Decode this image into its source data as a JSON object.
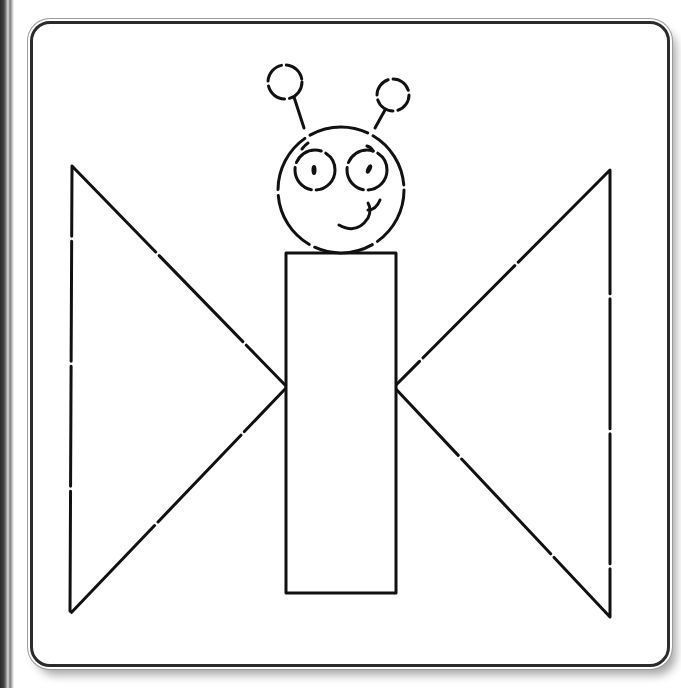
{
  "figure": {
    "shapes": {
      "head": {
        "type": "circle",
        "cx": 341,
        "cy": 190,
        "r": 63
      },
      "left_eye": {
        "type": "circle",
        "cx": 315,
        "cy": 170,
        "r": 20
      },
      "right_eye": {
        "type": "circle",
        "cx": 367,
        "cy": 170,
        "r": 20
      },
      "left_antenna_ball": {
        "type": "circle",
        "cx": 285,
        "cy": 82,
        "r": 17
      },
      "right_antenna_ball": {
        "type": "circle",
        "cx": 393,
        "cy": 95,
        "r": 16
      },
      "body": {
        "type": "rectangle",
        "x": 286,
        "y": 253,
        "width": 110,
        "height": 340
      },
      "left_wing": {
        "type": "triangle",
        "points": [
          [
            72,
            166
          ],
          [
            287,
            387
          ],
          [
            70,
            614
          ]
        ]
      },
      "right_wing": {
        "type": "triangle",
        "points": [
          [
            610,
            170
          ],
          [
            394,
            387
          ],
          [
            610,
            617
          ]
        ]
      }
    },
    "colors": {
      "stroke": "#111111",
      "frame": "#2b2b2b",
      "background": "#ffffff"
    }
  }
}
